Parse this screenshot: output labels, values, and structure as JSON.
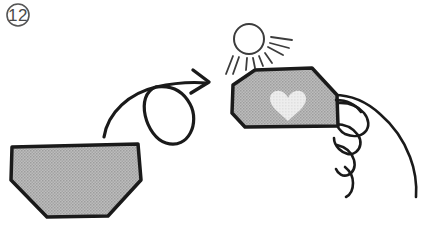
{
  "figure": {
    "kind": "instructional-line-art",
    "background_color": "#ffffff",
    "ink_color": "#1a1a1a",
    "step_badge": {
      "label": "12",
      "shape": "circle",
      "outline_color": "#555555",
      "text_color": "#4a4a4a",
      "center_x": 18,
      "center_y": 15,
      "radius": 11
    },
    "paper_before": {
      "name": "folded-paper-before",
      "fill_color": "#b4b4b4",
      "outline_color": "#1a1a1a",
      "outline_width": 3.5,
      "points": "12,147 138,144 141,180 108,216 47,217 11,180"
    },
    "flip_arrow": {
      "name": "flip-over-arrow",
      "stroke_color": "#1a1a1a",
      "stroke_width": 3.2,
      "curve_path": "M 104,137 C 108,112 130,93 156,87 C 178,82 195,82 207,83",
      "loop_path": "M 156,87 C 134,95 146,137 166,143 C 189,150 200,122 190,104 C 183,91 171,85 156,87",
      "head_path": "M 193,70 L 209,82 L 191,93"
    },
    "sun": {
      "name": "sun",
      "stroke_color": "#3c3c3c",
      "stroke_width": 2,
      "center_x": 249,
      "center_y": 39,
      "radius": 15,
      "rays": [
        "M 233,56 L 226,74",
        "M 239,57 L 233,74",
        "M 247,58 L 246,70",
        "M 253,58 L 255,68",
        "M 259,56 L 263,66",
        "M 265,53 L 272,63",
        "M 268,47 L 283,55",
        "M 270,43 L 289,48",
        "M 271,37 L 292,40"
      ]
    },
    "paper_after": {
      "name": "folded-paper-after",
      "fill_color": "#b4b4b4",
      "outline_color": "#1a1a1a",
      "outline_width": 3.5,
      "points": "255,70 312,68 337,95 338,126 245,127 232,113 233,85"
    },
    "heart": {
      "name": "heart-motif",
      "fill_color": "#e4e4e4",
      "center_x": 288,
      "center_y": 106,
      "width": 38,
      "height": 34,
      "path": "M 288,121 C 281,114 270,107 270,99 C 270,93 275,90 280,91 C 284,92 287,95 288,98 C 289,95 292,92 296,91 C 301,90 306,93 306,99 C 306,107 295,114 288,121 Z"
    },
    "hand": {
      "name": "hand-holding-paper",
      "stroke_color": "#1a1a1a",
      "stroke_width": 2.6,
      "fill_color": "#ffffff",
      "outlines": [
        "M 336,96 C 352,96 366,103 378,113 C 392,125 402,140 408,156 C 413,169 415,182 414,195",
        "M 337,104 C 348,103 357,106 363,113 C 368,119 369,126 365,131 C 361,136 353,137 346,134 C 341,132 338,127 337,122",
        "M 336,124 C 345,124 353,127 358,134 C 362,140 361,147 356,151 C 351,155 344,154 339,149 C 336,146 335,142 335,138",
        "M 338,144 C 346,146 352,152 354,159 C 356,166 353,172 348,174 C 343,176 338,173 336,168",
        "M 345,166 C 350,170 353,176 353,182 C 353,189 350,194 346,196"
      ]
    }
  }
}
